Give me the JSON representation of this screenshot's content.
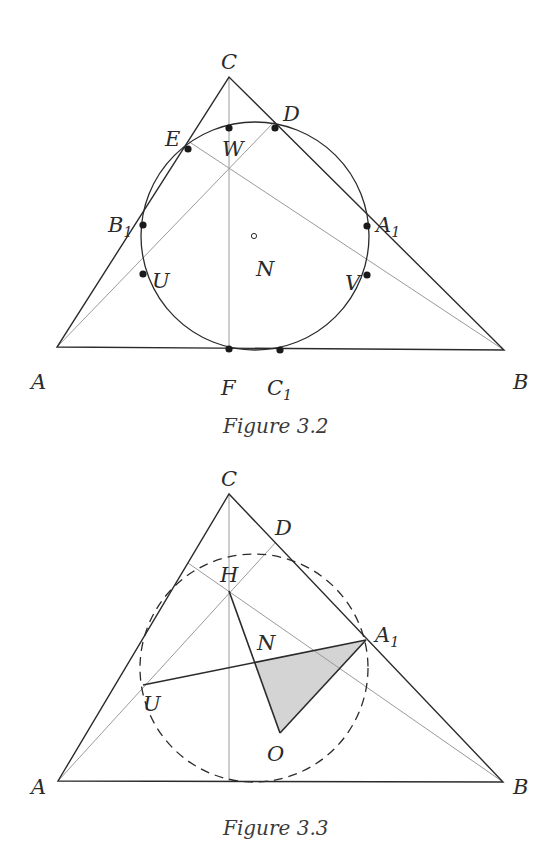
{
  "figures": [
    {
      "caption": "Figure 3.2",
      "labels": {
        "C": "C",
        "D": "D",
        "E": "E",
        "W": "W",
        "B1": "B",
        "B1_sub": "1",
        "A1": "A",
        "A1_sub": "1",
        "U": "U",
        "V": "V",
        "N": "N",
        "A": "A",
        "B": "B",
        "F": "F",
        "C1": "C",
        "C1_sub": "1"
      }
    },
    {
      "caption": "Figure 3.3",
      "labels": {
        "C": "C",
        "D": "D",
        "H": "H",
        "N": "N",
        "A1": "A",
        "A1_sub": "1",
        "U": "U",
        "O": "O",
        "A": "A",
        "B": "B"
      }
    }
  ],
  "colors": {
    "line": "#2b2b2b",
    "thin": "#9a9a9a",
    "shade": "#d4d4d4"
  }
}
